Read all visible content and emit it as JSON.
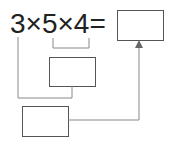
{
  "expression": {
    "text": "3×5×4=",
    "terms": [
      "3",
      "5",
      "4"
    ],
    "operator": "×",
    "equals": "="
  },
  "boxes": {
    "result": "",
    "intermediate": "",
    "bottom": ""
  },
  "colors": {
    "line": "#777777",
    "text": "#222222"
  }
}
